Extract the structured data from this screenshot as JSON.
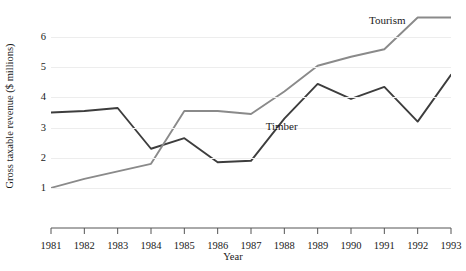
{
  "chart_data": {
    "type": "line",
    "title": "",
    "xlabel": "Year",
    "ylabel": "Gross taxable revenue ($ millions)",
    "categories": [
      1981,
      1982,
      1983,
      1984,
      1985,
      1986,
      1987,
      1988,
      1989,
      1990,
      1991,
      1992,
      1993
    ],
    "xlim": [
      1981,
      1993
    ],
    "ylim": [
      0.6,
      6.9
    ],
    "yticks": [
      1,
      2,
      3,
      4,
      5,
      6
    ],
    "ytick_labels": [
      "1",
      "2",
      "3",
      "4",
      "5",
      "6"
    ],
    "xtick_labels": [
      "1981",
      "1982",
      "1983",
      "1984",
      "1985",
      "1986",
      "1987",
      "1988",
      "1989",
      "1990",
      "1991",
      "1992",
      "1993"
    ],
    "grid": "horizontal",
    "legend_position": "inline-annotations",
    "series": [
      {
        "name": "Timber",
        "color": "#3d3d3d",
        "label_x": 1988.1,
        "label_y": 3.02,
        "values": [
          3.5,
          3.55,
          3.65,
          2.3,
          2.65,
          1.85,
          1.9,
          3.3,
          4.45,
          3.95,
          4.35,
          3.2,
          4.75
        ]
      },
      {
        "name": "Tourism",
        "color": "#8a8a8a",
        "label_x": 1991.2,
        "label_y": 6.55,
        "values": [
          1.0,
          1.3,
          1.55,
          1.8,
          3.55,
          3.55,
          3.45,
          4.2,
          5.05,
          5.35,
          5.6,
          6.65,
          6.65
        ]
      }
    ]
  }
}
